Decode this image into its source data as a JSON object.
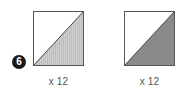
{
  "step": {
    "number": "6"
  },
  "blocks": [
    {
      "name": "half-square-triangle-light",
      "fill_color": "#c9c9c9",
      "border_color": "#555555",
      "quantity_label": "x 12"
    },
    {
      "name": "half-square-triangle-dark",
      "fill_color": "#8a8a8a",
      "border_color": "#555555",
      "quantity_label": "x 12"
    }
  ]
}
